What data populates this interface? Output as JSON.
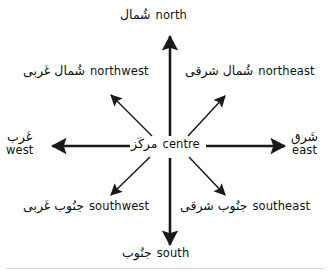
{
  "diagram": {
    "type": "compass-rose",
    "background_color": "#ffffff",
    "stroke_color": "#1a1a1a",
    "center": {
      "name": "centre",
      "arabic": "مرکَز",
      "english": "centre",
      "x": 170,
      "y": 147
    },
    "directions": [
      {
        "key": "north",
        "arabic": "شُمال",
        "english": "north",
        "arrow": "thick",
        "angle_deg": 90,
        "tip": {
          "x": 170,
          "y": 33
        }
      },
      {
        "key": "northeast",
        "arabic": "شُمال شرقی",
        "english": "northeast",
        "arrow": "thin",
        "angle_deg": 45,
        "tip": {
          "x": 228,
          "y": 93
        }
      },
      {
        "key": "east",
        "arabic": "شَرق",
        "english": "east",
        "arrow": "thick",
        "angle_deg": 0,
        "tip": {
          "x": 288,
          "y": 146
        }
      },
      {
        "key": "southeast",
        "arabic": "جنُوب شرقی",
        "english": "southeast",
        "arrow": "thin",
        "angle_deg": -45,
        "tip": {
          "x": 228,
          "y": 198
        }
      },
      {
        "key": "south",
        "arabic": "جنُوب",
        "english": "south",
        "arrow": "thick",
        "angle_deg": -90,
        "tip": {
          "x": 170,
          "y": 248
        }
      },
      {
        "key": "southwest",
        "arabic": "جنُوب غَربی",
        "english": "southwest",
        "arrow": "thin",
        "angle_deg": -135,
        "tip": {
          "x": 108,
          "y": 198
        }
      },
      {
        "key": "west",
        "arabic": "غَرب",
        "english": "west",
        "arrow": "thick",
        "angle_deg": 180,
        "tip": {
          "x": 48,
          "y": 146
        }
      },
      {
        "key": "northwest",
        "arabic": "شُمال غَربی",
        "english": "northwest",
        "arrow": "thin",
        "angle_deg": 135,
        "tip": {
          "x": 108,
          "y": 92
        }
      }
    ]
  }
}
